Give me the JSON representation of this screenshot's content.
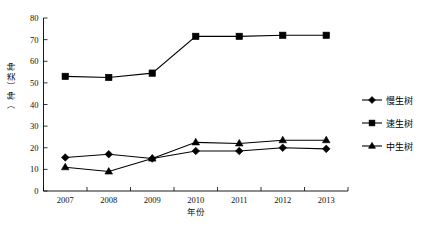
{
  "chart_data": {
    "type": "line",
    "title": "",
    "xlabel": "年份",
    "ylabel": "种类（种）",
    "categories": [
      "2007",
      "2008",
      "2009",
      "2010",
      "2011",
      "2012",
      "2013"
    ],
    "x": [
      2007,
      2008,
      2009,
      2010,
      2011,
      2012,
      2013
    ],
    "ylim": [
      0,
      80
    ],
    "yticks": [
      0,
      10,
      20,
      30,
      40,
      50,
      60,
      70,
      80
    ],
    "ytick_labels": [
      "0",
      "10",
      "20",
      "30",
      "40",
      "50",
      "60",
      "70",
      "80"
    ],
    "grid": false,
    "legend_position": "right",
    "series": [
      {
        "name": "慢生树",
        "marker": "diamond",
        "color": "#000000",
        "values": [
          15.5,
          17,
          15,
          18.5,
          18.5,
          20,
          19.5
        ]
      },
      {
        "name": "速生树",
        "marker": "square",
        "color": "#000000",
        "values": [
          53,
          52.5,
          54.5,
          71.5,
          71.5,
          72,
          72
        ]
      },
      {
        "name": "中生树",
        "marker": "triangle",
        "color": "#000000",
        "values": [
          11,
          9,
          15,
          22.5,
          22,
          23.5,
          23.5
        ]
      }
    ]
  },
  "axis": {
    "y_label_chars": [
      "种",
      "类",
      "（",
      "种",
      "）"
    ]
  },
  "legend": {
    "entries": [
      {
        "label": "慢生树",
        "marker": "diamond"
      },
      {
        "label": "速生树",
        "marker": "square"
      },
      {
        "label": "中生树",
        "marker": "triangle"
      }
    ]
  }
}
